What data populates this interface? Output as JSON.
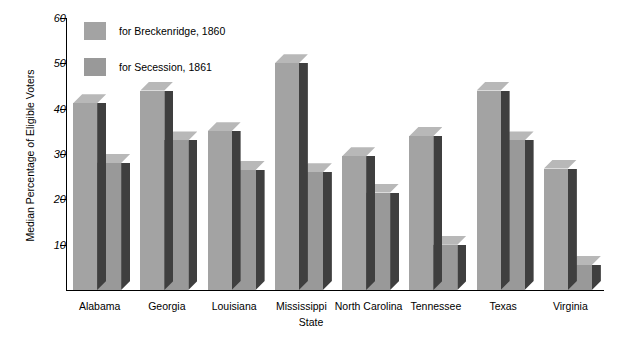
{
  "chart_data": {
    "type": "bar",
    "title": "",
    "xlabel": "State",
    "ylabel": "Median Percentage of Eligible Voters",
    "categories": [
      "Alabama",
      "Georgia",
      "Louisiana",
      "Mississippi",
      "North Carolina",
      "Tennessee",
      "Texas",
      "Virginia"
    ],
    "series": [
      {
        "name": "for Breckenridge, 1860",
        "color": "#a3a3a3",
        "values": [
          41.2,
          44.0,
          35.0,
          50.0,
          29.5,
          34.0,
          44.0,
          26.8
        ]
      },
      {
        "name": "for Secession, 1861",
        "color": "#999999",
        "values": [
          28.0,
          33.0,
          26.5,
          26.0,
          21.5,
          10.0,
          33.0,
          5.5
        ]
      }
    ],
    "yticks": [
      10,
      20,
      30,
      40,
      50,
      60
    ],
    "ytick_labels": [
      "10",
      "20",
      "30",
      "40",
      "50",
      "60"
    ],
    "ylim": [
      0,
      60
    ],
    "grid": false,
    "legend_position": "upper-left-inside",
    "style": "3d-bars",
    "colors": {
      "bar_front_series1": "#a3a3a3",
      "bar_front_series2": "#999999",
      "bar_side": "#3f3f3f",
      "bar_top": "#b8b8b8",
      "axis": "#000000",
      "background": "#ffffff"
    }
  },
  "legend": {
    "items": [
      {
        "label": "for Breckenridge, 1860",
        "swatch": "#a3a3a3"
      },
      {
        "label": "for Secession, 1861",
        "swatch": "#999999"
      }
    ]
  }
}
